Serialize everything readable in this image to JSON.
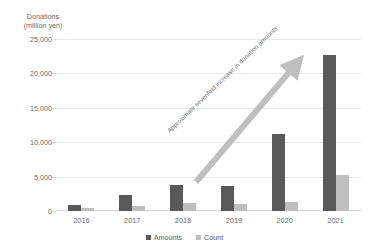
{
  "title_strip": {
    "left_fragment": "",
    "right_fragment": ""
  },
  "axis_title": "Donations\n(million yen)",
  "axis_title_line1": "Donations",
  "axis_title_line2": "(million yen)",
  "annotation": {
    "text": "Approximate sevenfold increase in donation amounts",
    "arrow_direction": "up-right",
    "color": "#BFBFBF"
  },
  "legend": {
    "position": "bottom-center",
    "items": [
      {
        "label": "Amounts",
        "color": "#595959"
      },
      {
        "label": "Count",
        "color": "#BFBFBF"
      }
    ]
  },
  "chart_data": {
    "type": "bar",
    "title": "",
    "xlabel": "",
    "ylabel": "Donations (million yen)",
    "ylim": [
      0,
      25000
    ],
    "yticks": [
      0,
      5000,
      10000,
      15000,
      20000,
      25000
    ],
    "ytick_labels": [
      "0",
      "5,000",
      "10,000",
      "15,000",
      "20,000",
      "25,000"
    ],
    "grid": true,
    "legend_position": "bottom",
    "categories": [
      "2016",
      "2017",
      "2018",
      "2019",
      "2020",
      "2021"
    ],
    "series": [
      {
        "name": "Amounts",
        "color": "#595959",
        "values": [
          900,
          2400,
          3800,
          3700,
          11200,
          22700
        ]
      },
      {
        "name": "Count",
        "color": "#BFBFBF",
        "values": [
          500,
          800,
          1100,
          1000,
          1300,
          5200
        ]
      }
    ]
  }
}
